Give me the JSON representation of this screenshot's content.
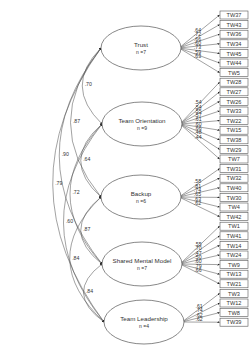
{
  "diagram": {
    "colors": {
      "stroke": "#555555",
      "text": "#333333",
      "background": "#ffffff"
    },
    "factors": [
      {
        "name": "Trust",
        "n_label": "n =7",
        "cx": 141,
        "cy": 48,
        "indicators": [
          "TW37",
          "TW43",
          "TW36",
          "TW34",
          "TW45",
          "TW44",
          "TW5"
        ],
        "loadings": [
          ".64",
          ".72",
          ".66",
          ".60",
          ".73",
          ".59",
          ".63"
        ]
      },
      {
        "name": "Team Orientation",
        "n_label": "n =9",
        "cx": 142,
        "cy": 124,
        "indicators": [
          "TW28",
          "TW27",
          "TW26",
          "TW33",
          "TW22",
          "TW15",
          "TW38",
          "TW29",
          "TW7"
        ],
        "loadings": [
          ".54",
          ".54",
          ".55",
          ".57",
          ".61",
          ".60",
          ".66",
          ".48",
          ".44"
        ]
      },
      {
        "name": "Backup",
        "n_label": "n =6",
        "cx": 141,
        "cy": 197,
        "indicators": [
          "TW31",
          "TW32",
          "TW40",
          "TW30",
          "TW4",
          "TW42"
        ],
        "loadings": [
          ".58",
          ".81",
          ".74",
          ".65",
          ".63",
          ".62"
        ]
      },
      {
        "name": "Shared Mental Model",
        "n_label": "n =7",
        "cx": 142,
        "cy": 264,
        "indicators": [
          "TW1",
          "TW41",
          "TW14",
          "TW24",
          "TW9",
          "TW13",
          "TW21"
        ],
        "loadings": [
          ".55",
          ".70",
          ".47",
          ".50",
          ".60",
          ".79",
          ".66"
        ]
      },
      {
        "name": "Team Leadership",
        "n_label": "n =4",
        "cx": 144,
        "cy": 322,
        "indicators": [
          "TW3",
          "TW12",
          "TW8",
          "TW39"
        ],
        "loadings": [
          ".61",
          ".74",
          ".62",
          ".62"
        ]
      }
    ],
    "correlations": [
      {
        "from": "Trust",
        "to": "Team Orientation",
        "value": ".70"
      },
      {
        "from": "Trust",
        "to": "Backup",
        "value": ".87"
      },
      {
        "from": "Trust",
        "to": "Shared Mental Model",
        "value": ".90"
      },
      {
        "from": "Trust",
        "to": "Team Leadership",
        "value": ".79"
      },
      {
        "from": "Team Orientation",
        "to": "Backup",
        "value": ".64"
      },
      {
        "from": "Team Orientation",
        "to": "Shared Mental Model",
        "value": ".72"
      },
      {
        "from": "Team Orientation",
        "to": "Team Leadership",
        "value": ".60"
      },
      {
        "from": "Backup",
        "to": "Shared Mental Model",
        "value": ".87"
      },
      {
        "from": "Backup",
        "to": "Team Leadership",
        "value": ".84"
      },
      {
        "from": "Shared Mental Model",
        "to": "Team Leadership",
        "value": ".84"
      }
    ]
  }
}
